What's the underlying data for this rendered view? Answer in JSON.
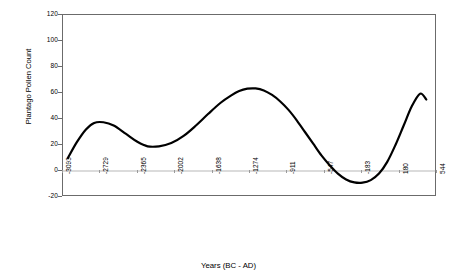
{
  "chart_data": {
    "type": "line",
    "title": "",
    "xlabel": "Years (BC - AD)",
    "ylabel": "Plantago Pollen Count",
    "xlim": [
      -3093,
      544
    ],
    "ylim": [
      -20,
      120
    ],
    "grid": false,
    "legend": null,
    "x_tick_labels": [
      "-3093",
      "-2729",
      "-2365",
      "-2002",
      "-1638",
      "-1274",
      "-911",
      "-547",
      "-183",
      "180",
      "544"
    ],
    "x_tick_values": [
      -3093,
      -2729,
      -2365,
      -2002,
      -1638,
      -1274,
      -911,
      -547,
      -183,
      180,
      544
    ],
    "y_tick_labels": [
      "120",
      "100",
      "80",
      "60",
      "40",
      "20",
      "0",
      "-20"
    ],
    "y_tick_values": [
      120,
      100,
      80,
      60,
      40,
      20,
      0,
      -20
    ],
    "series": [
      {
        "name": "Plantago Pollen Count",
        "color": "#000000",
        "x": [
          -3045,
          -2960,
          -2870,
          -2790,
          -2700,
          -2600,
          -2480,
          -2370,
          -2270,
          -2160,
          -2040,
          -1920,
          -1800,
          -1680,
          -1560,
          -1460,
          -1380,
          -1300,
          -1220,
          -1140,
          -1060,
          -980,
          -900,
          -820,
          -740,
          -660,
          -580,
          -500,
          -420,
          -340,
          -260,
          -180,
          -100,
          -20,
          60,
          140,
          220,
          300,
          380,
          440
        ],
        "values": [
          10,
          22,
          32,
          37,
          37.5,
          35,
          28.5,
          22.5,
          19,
          19,
          21.5,
          27,
          35,
          44,
          52.5,
          58,
          61.5,
          63.3,
          63.5,
          62,
          58.5,
          53.5,
          47,
          39,
          30,
          21,
          12,
          4.5,
          -2,
          -6.5,
          -8.8,
          -9,
          -7,
          -2,
          7,
          20,
          35,
          50,
          59.5,
          55
        ]
      }
    ],
    "annotations": []
  },
  "axis": {
    "y_title": "Plantago Pollen Count",
    "x_title": "Years (BC - AD)"
  }
}
